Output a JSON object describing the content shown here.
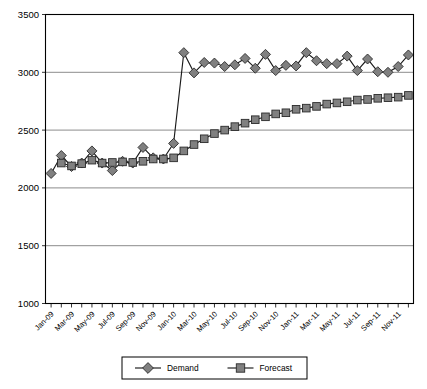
{
  "chart_data": {
    "type": "line",
    "title": "",
    "subtitle": "",
    "xlabel": "",
    "ylabel": "",
    "ylim": [
      1000,
      3500
    ],
    "ytick_step": 500,
    "ytick_labels": [
      "1000",
      "1500",
      "2000",
      "2500",
      "3000",
      "3500"
    ],
    "grid": true,
    "grid_axis": "y",
    "legend_position": "bottom-center",
    "x": [
      "Jan-09",
      "Feb-09",
      "Mar-09",
      "Apr-09",
      "May-09",
      "Jun-09",
      "Jul-09",
      "Aug-09",
      "Sep-09",
      "Oct-09",
      "Nov-09",
      "Dec-09",
      "Jan-10",
      "Feb-10",
      "Mar-10",
      "Apr-10",
      "May-10",
      "Jun-10",
      "Jul-10",
      "Aug-10",
      "Sep-10",
      "Oct-10",
      "Nov-10",
      "Dec-10",
      "Jan-11",
      "Feb-11",
      "Mar-11",
      "Apr-11",
      "May-11",
      "Jun-11",
      "Jul-11",
      "Aug-11",
      "Sep-11",
      "Oct-11",
      "Nov-11",
      "Dec-11"
    ],
    "xtick_labels_shown": [
      "Jan-09",
      "Mar-09",
      "May-09",
      "Jul-09",
      "Sep-09",
      "Nov-09",
      "Jan-10",
      "Mar-10",
      "May-10",
      "Jul-10",
      "Sep-10",
      "Nov-10",
      "Jan-11",
      "Mar-11",
      "May-11",
      "Jul-11",
      "Sep-11",
      "Nov-11"
    ],
    "xtick_label_rotation_deg": 45,
    "series": [
      {
        "name": "Demand",
        "marker": "diamond",
        "color": "#808080",
        "line_color": "#1a1a1a",
        "values": [
          2125,
          2280,
          2185,
          2215,
          2320,
          2215,
          2150,
          2230,
          2215,
          2350,
          2260,
          2250,
          2385,
          3170,
          2995,
          3085,
          3080,
          3050,
          3065,
          3120,
          3035,
          3155,
          3015,
          3060,
          3055,
          3170,
          3100,
          3075,
          3075,
          3140,
          3015,
          3115,
          3005,
          3000,
          3050,
          3150
        ]
      },
      {
        "name": "Forecast",
        "marker": "square",
        "color": "#808080",
        "line_color": "#1a1a1a",
        "values": [
          null,
          2215,
          2190,
          2210,
          2240,
          2215,
          2220,
          2225,
          2220,
          2230,
          2250,
          2250,
          2260,
          2320,
          2375,
          2425,
          2470,
          2500,
          2530,
          2560,
          2590,
          2615,
          2640,
          2650,
          2680,
          2690,
          2705,
          2725,
          2735,
          2745,
          2760,
          2765,
          2775,
          2780,
          2785,
          2800
        ]
      }
    ]
  },
  "legend": {
    "items": [
      {
        "label": "Demand",
        "marker": "diamond"
      },
      {
        "label": "Forecast",
        "marker": "square"
      }
    ]
  },
  "colors": {
    "marker_fill": "#808080",
    "marker_stroke": "#2b2b2b",
    "line": "#1a1a1a",
    "grid": "#7f7f7f",
    "axis": "#000000",
    "background": "#ffffff"
  }
}
